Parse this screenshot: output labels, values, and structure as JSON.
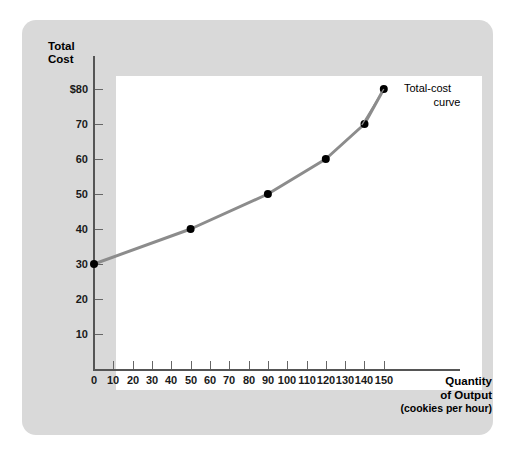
{
  "chart_data": {
    "type": "line",
    "title": "",
    "xlabel": "Quantity of Output (cookies per hour)",
    "ylabel": "Total Cost",
    "xlabel_line1": "Quantity",
    "xlabel_line2": "of Output",
    "xlabel_line3": "(cookies per hour)",
    "ylabel_line1": "Total",
    "ylabel_line2": "Cost",
    "xlim": [
      0,
      155
    ],
    "ylim": [
      0,
      85
    ],
    "grid": false,
    "legend_position": "inline-annotation",
    "series": [
      {
        "name": "Total-cost curve",
        "annotation_line1": "Total-cost",
        "annotation_line2": "curve",
        "color": "#8c8c8c",
        "marker_color": "#000000",
        "x": [
          0,
          50,
          90,
          120,
          140,
          150
        ],
        "y": [
          30,
          40,
          50,
          60,
          70,
          80
        ],
        "points": [
          {
            "x": 0,
            "y": 30
          },
          {
            "x": 50,
            "y": 40
          },
          {
            "x": 90,
            "y": 50
          },
          {
            "x": 120,
            "y": 60
          },
          {
            "x": 140,
            "y": 70
          },
          {
            "x": 150,
            "y": 80
          }
        ]
      }
    ],
    "x_ticks": [
      0,
      10,
      20,
      30,
      40,
      50,
      60,
      70,
      80,
      90,
      100,
      110,
      120,
      130,
      140,
      150
    ],
    "x_tick_labels": [
      "0",
      "10",
      "20",
      "30",
      "40",
      "50",
      "60",
      "70",
      "80",
      "90",
      "100",
      "110",
      "120",
      "130",
      "140",
      "150"
    ],
    "y_ticks": [
      10,
      20,
      30,
      40,
      50,
      60,
      70,
      80
    ],
    "y_tick_labels": [
      "10",
      "20",
      "30",
      "40",
      "50",
      "60",
      "70",
      "$80"
    ]
  },
  "colors": {
    "card_background": "#d9d9d9",
    "plot_background": "#ffffff",
    "axis": "#555555",
    "curve": "#8c8c8c",
    "marker": "#000000",
    "text": "#000000"
  }
}
